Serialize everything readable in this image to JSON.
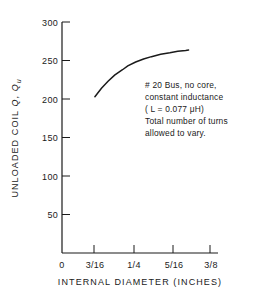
{
  "chart_data": {
    "type": "line",
    "title": "",
    "xlabel": "INTERNAL DIAMETER (INCHES)",
    "ylabel": "UNLOADED COIL Q, Qu",
    "ylabel_parts": {
      "prefix": "UNLOADED COIL ",
      "symbol1": "Q",
      "separator": ", ",
      "symbol2": "Q",
      "subscript": "u"
    },
    "xlim": [
      0.125,
      0.40625
    ],
    "ylim": [
      0,
      300
    ],
    "grid": false,
    "legend": null,
    "x_tick_labels": [
      "0",
      "3/16",
      "1/4",
      "5/16",
      "3/8"
    ],
    "x_tick_values": [
      0,
      0.1875,
      0.25,
      0.3125,
      0.375
    ],
    "y_tick_labels": [
      "0",
      "50",
      "100",
      "150",
      "200",
      "250",
      "300"
    ],
    "y_tick_values": [
      0,
      50,
      100,
      150,
      200,
      250,
      300
    ],
    "series": [
      {
        "name": "Unloaded Q vs internal diameter",
        "x": [
          0.1875,
          0.2,
          0.2125,
          0.225,
          0.24,
          0.25,
          0.265,
          0.28,
          0.295,
          0.3125,
          0.33,
          0.345,
          0.36,
          0.3655
        ],
        "y": [
          203,
          214,
          223,
          231,
          238,
          243,
          248,
          252,
          255,
          258,
          260,
          262,
          263,
          263.5
        ]
      }
    ],
    "annotations": [
      {
        "name": "curve-note",
        "lines": [
          "# 20 Bus, no core,",
          "constant inductance",
          "( L = 0.077 μH)",
          "Total number of turns",
          "allowed to vary."
        ]
      }
    ]
  },
  "axes": {
    "x_axis_name": "internal-diameter-axis",
    "y_axis_name": "unloaded-q-axis"
  },
  "colors": {
    "background": "#ffffff",
    "ink": "#1a1a1a",
    "curve": "#1a1a1a"
  }
}
